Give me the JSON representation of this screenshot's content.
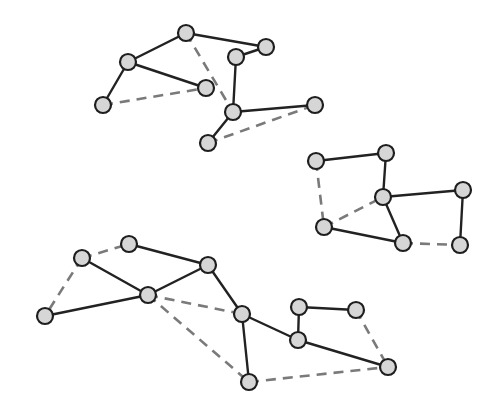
{
  "diagram": {
    "type": "graph",
    "style": {
      "background": "#ffffff",
      "node_fill": "#d6d6d6",
      "node_stroke": "#1e1e1e",
      "node_radius": 8,
      "solid_edge_color": "#222222",
      "dashed_edge_color": "#7a7a7a"
    },
    "clusters": [
      {
        "id": "cluster-top",
        "nodes": [
          {
            "id": "a1",
            "x": 186,
            "y": 33
          },
          {
            "id": "a2",
            "x": 266,
            "y": 47
          },
          {
            "id": "a3",
            "x": 236,
            "y": 57
          },
          {
            "id": "a4",
            "x": 128,
            "y": 62
          },
          {
            "id": "a5",
            "x": 206,
            "y": 88
          },
          {
            "id": "a6",
            "x": 103,
            "y": 105
          },
          {
            "id": "a7",
            "x": 233,
            "y": 112
          },
          {
            "id": "a8",
            "x": 315,
            "y": 105
          },
          {
            "id": "a9",
            "x": 208,
            "y": 143
          }
        ],
        "edges": [
          {
            "from": "a1",
            "to": "a2",
            "style": "solid"
          },
          {
            "from": "a1",
            "to": "a4",
            "style": "solid"
          },
          {
            "from": "a4",
            "to": "a5",
            "style": "solid"
          },
          {
            "from": "a4",
            "to": "a6",
            "style": "solid"
          },
          {
            "from": "a2",
            "to": "a3",
            "style": "solid"
          },
          {
            "from": "a3",
            "to": "a7",
            "style": "solid"
          },
          {
            "from": "a7",
            "to": "a8",
            "style": "solid"
          },
          {
            "from": "a7",
            "to": "a9",
            "style": "solid"
          },
          {
            "from": "a6",
            "to": "a5",
            "style": "dashed"
          },
          {
            "from": "a1",
            "to": "a7",
            "style": "dashed"
          },
          {
            "from": "a9",
            "to": "a8",
            "style": "dashed"
          }
        ]
      },
      {
        "id": "cluster-right",
        "nodes": [
          {
            "id": "b1",
            "x": 316,
            "y": 161
          },
          {
            "id": "b2",
            "x": 386,
            "y": 153
          },
          {
            "id": "b3",
            "x": 383,
            "y": 197
          },
          {
            "id": "b4",
            "x": 463,
            "y": 190
          },
          {
            "id": "b5",
            "x": 324,
            "y": 227
          },
          {
            "id": "b6",
            "x": 403,
            "y": 243
          },
          {
            "id": "b7",
            "x": 460,
            "y": 245
          }
        ],
        "edges": [
          {
            "from": "b1",
            "to": "b2",
            "style": "solid"
          },
          {
            "from": "b2",
            "to": "b3",
            "style": "solid"
          },
          {
            "from": "b3",
            "to": "b4",
            "style": "solid"
          },
          {
            "from": "b4",
            "to": "b7",
            "style": "solid"
          },
          {
            "from": "b3",
            "to": "b6",
            "style": "solid"
          },
          {
            "from": "b5",
            "to": "b6",
            "style": "solid"
          },
          {
            "from": "b1",
            "to": "b5",
            "style": "dashed"
          },
          {
            "from": "b5",
            "to": "b3",
            "style": "dashed"
          },
          {
            "from": "b6",
            "to": "b7",
            "style": "dashed"
          }
        ]
      },
      {
        "id": "cluster-bottom",
        "nodes": [
          {
            "id": "c1",
            "x": 129,
            "y": 244
          },
          {
            "id": "c2",
            "x": 82,
            "y": 258
          },
          {
            "id": "c3",
            "x": 208,
            "y": 265
          },
          {
            "id": "c4",
            "x": 148,
            "y": 295
          },
          {
            "id": "c5",
            "x": 45,
            "y": 316
          },
          {
            "id": "c6",
            "x": 242,
            "y": 314
          },
          {
            "id": "c7",
            "x": 299,
            "y": 307
          },
          {
            "id": "c8",
            "x": 356,
            "y": 310
          },
          {
            "id": "c9",
            "x": 298,
            "y": 340
          },
          {
            "id": "c10",
            "x": 388,
            "y": 367
          },
          {
            "id": "c11",
            "x": 249,
            "y": 382
          }
        ],
        "edges": [
          {
            "from": "c2",
            "to": "c4",
            "style": "solid"
          },
          {
            "from": "c1",
            "to": "c3",
            "style": "solid"
          },
          {
            "from": "c5",
            "to": "c4",
            "style": "solid"
          },
          {
            "from": "c4",
            "to": "c3",
            "style": "solid"
          },
          {
            "from": "c3",
            "to": "c6",
            "style": "solid"
          },
          {
            "from": "c6",
            "to": "c9",
            "style": "solid"
          },
          {
            "from": "c6",
            "to": "c11",
            "style": "solid"
          },
          {
            "from": "c9",
            "to": "c7",
            "style": "solid"
          },
          {
            "from": "c7",
            "to": "c8",
            "style": "solid"
          },
          {
            "from": "c9",
            "to": "c10",
            "style": "solid"
          },
          {
            "from": "c2",
            "to": "c1",
            "style": "dashed"
          },
          {
            "from": "c2",
            "to": "c5",
            "style": "dashed"
          },
          {
            "from": "c4",
            "to": "c6",
            "style": "dashed"
          },
          {
            "from": "c4",
            "to": "c11",
            "style": "dashed"
          },
          {
            "from": "c11",
            "to": "c10",
            "style": "dashed"
          },
          {
            "from": "c8",
            "to": "c10",
            "style": "dashed"
          }
        ]
      }
    ]
  }
}
